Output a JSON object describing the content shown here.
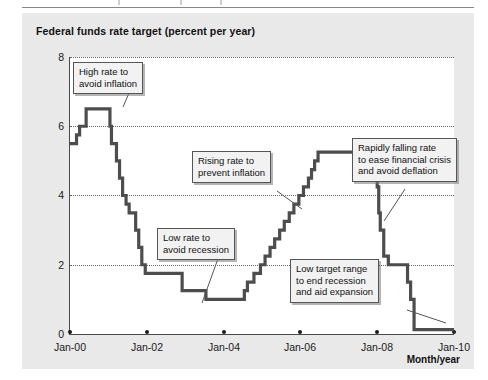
{
  "chart_title": "Federal funds rate target (percent per year)",
  "x_axis_title": "Month/year",
  "y_axis": {
    "ticks": [
      "0",
      "2",
      "4",
      "6",
      "8"
    ],
    "min": 0,
    "max": 8
  },
  "x_axis": {
    "ticks": [
      "Jan-00",
      "Jan-02",
      "Jan-04",
      "Jan-06",
      "Jan-08",
      "Jan-10"
    ]
  },
  "annotations": [
    {
      "id": "high-rate",
      "lines": [
        "High rate to",
        "avoid inflation"
      ]
    },
    {
      "id": "low-rate",
      "lines": [
        "Low rate to",
        "avoid recession"
      ]
    },
    {
      "id": "rising-rate",
      "lines": [
        "Rising rate to",
        "prevent inflation"
      ]
    },
    {
      "id": "falling-rate",
      "lines": [
        "Rapidly falling rate",
        "to ease financial crisis",
        "and avoid deflation"
      ]
    },
    {
      "id": "low-target-range",
      "lines": [
        "Low target range",
        "to end recession",
        "and aid expansion"
      ]
    }
  ],
  "colors": {
    "panel": "#e9e9e9",
    "plot": "#ffffff",
    "line": "#4d4d4d",
    "axis": "#4a4a4a",
    "grid": "#666666",
    "callout_bg": "#f2f2f2"
  },
  "chart_data": {
    "type": "line",
    "title": "Federal funds rate target (percent per year)",
    "xlabel": "Month/year",
    "ylabel": "",
    "ylim": [
      0,
      8
    ],
    "xlim": [
      2000.0,
      2010.0
    ],
    "grid": true,
    "legend": "none",
    "style": "step",
    "categories": [
      "Jan-00",
      "Jan-02",
      "Jan-04",
      "Jan-06",
      "Jan-08",
      "Jan-10"
    ],
    "series": [
      {
        "name": "Federal funds rate target",
        "points": [
          [
            2000.0,
            5.5
          ],
          [
            2000.17,
            5.75
          ],
          [
            2000.25,
            6.0
          ],
          [
            2000.42,
            6.5
          ],
          [
            2001.0,
            6.5
          ],
          [
            2001.04,
            6.0
          ],
          [
            2001.08,
            5.5
          ],
          [
            2001.21,
            5.0
          ],
          [
            2001.29,
            4.5
          ],
          [
            2001.37,
            4.0
          ],
          [
            2001.46,
            3.75
          ],
          [
            2001.54,
            3.5
          ],
          [
            2001.62,
            3.5
          ],
          [
            2001.71,
            3.0
          ],
          [
            2001.79,
            2.5
          ],
          [
            2001.87,
            2.0
          ],
          [
            2001.96,
            1.75
          ],
          [
            2002.87,
            1.75
          ],
          [
            2002.92,
            1.25
          ],
          [
            2003.5,
            1.25
          ],
          [
            2003.54,
            1.0
          ],
          [
            2004.5,
            1.0
          ],
          [
            2004.54,
            1.25
          ],
          [
            2004.62,
            1.5
          ],
          [
            2004.79,
            1.75
          ],
          [
            2004.96,
            2.0
          ],
          [
            2005.08,
            2.25
          ],
          [
            2005.21,
            2.5
          ],
          [
            2005.33,
            2.75
          ],
          [
            2005.46,
            3.0
          ],
          [
            2005.58,
            3.25
          ],
          [
            2005.71,
            3.5
          ],
          [
            2005.83,
            3.75
          ],
          [
            2005.96,
            4.0
          ],
          [
            2006.08,
            4.25
          ],
          [
            2006.21,
            4.5
          ],
          [
            2006.29,
            4.75
          ],
          [
            2006.37,
            5.0
          ],
          [
            2006.46,
            5.25
          ],
          [
            2007.62,
            5.25
          ],
          [
            2007.71,
            4.75
          ],
          [
            2007.87,
            4.5
          ],
          [
            2008.0,
            4.25
          ],
          [
            2008.04,
            3.5
          ],
          [
            2008.08,
            3.0
          ],
          [
            2008.17,
            2.25
          ],
          [
            2008.29,
            2.0
          ],
          [
            2008.79,
            1.5
          ],
          [
            2008.87,
            1.0
          ],
          [
            2008.96,
            0.125
          ],
          [
            2010.0,
            0.125
          ]
        ]
      }
    ],
    "annotations": [
      {
        "text": "High rate to avoid inflation",
        "points_to_x": 2000.5,
        "points_to_y": 6.5
      },
      {
        "text": "Low rate to avoid recession",
        "points_to_x": 2004.0,
        "points_to_y": 1.0
      },
      {
        "text": "Rising rate to prevent inflation",
        "points_to_x": 2005.9,
        "points_to_y": 4.0
      },
      {
        "text": "Rapidly falling rate to ease financial crisis and avoid deflation",
        "points_to_x": 2008.1,
        "points_to_y": 3.2
      },
      {
        "text": "Low target range to end recession and aid expansion",
        "points_to_x": 2009.6,
        "points_to_y": 0.125
      }
    ]
  }
}
